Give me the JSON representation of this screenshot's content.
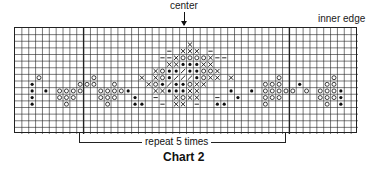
{
  "labels": {
    "center": "center",
    "inner_edge": "inner edge",
    "repeat": "repeat 5 times",
    "title": "Chart 2"
  },
  "chart_data": {
    "type": "knitting-chart",
    "title": "Chart 2",
    "columns": 50,
    "rows": 16,
    "center_column": 25,
    "repeat": {
      "label": "repeat 5 times",
      "start_col": 10,
      "end_col": 39
    },
    "thick_columns": [
      10,
      40
    ],
    "legend_symbols": {
      "x": "cross",
      "o": "circle",
      "*": "dot",
      "/": "slash",
      "-": "dash",
      ".": "empty"
    },
    "pattern": [
      "..................................................",
      "..................................................",
      ".........................x........................",
      "......................-.xxx.-.....................",
      ".....................--xoooox--...................",
      "......................xx***xx.....................",
      "....................xo**/**oox....................",
      "...o.......o......x.xo*///*oxx.x......o.......o...",
      "..*......ooo..o....xo*/**oxx........ooo..*...oo...",
      "..*.*.oooo..oooo*...xx***xx....*..*.ooooo.o.ooo*..",
      "..*...ooo...ooo..*..-..xoxx..-..*...ooo.....ooo*..",
      "..*....o.....o...**..-.xx.-..**.....o........o.*..",
      "..................................................",
      "..................................................",
      "..................................................",
      ".................................................."
    ],
    "colors": {
      "grid_line": "#222222",
      "symbol": "#111111",
      "background": "#ffffff"
    }
  }
}
